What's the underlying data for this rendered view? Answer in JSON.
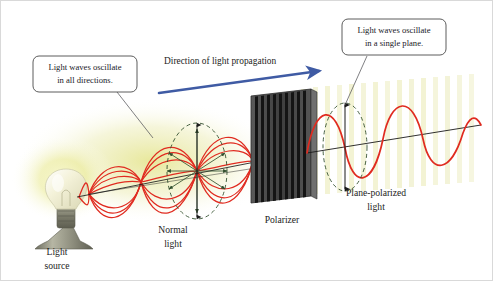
{
  "figure": {
    "background_color": "#ffffff",
    "border_color": "#d9d9d9"
  },
  "callouts": [
    {
      "id": "unpolarized-callout",
      "line1": "Light waves oscillate",
      "line2": "in all directions.",
      "box_fill": "#ffffff",
      "box_stroke": "#4a4a4a",
      "leader_color": "#55565a"
    },
    {
      "id": "polarized-callout",
      "line1": "Light waves oscillate",
      "line2": "in a single plane.",
      "box_fill": "#ffffff",
      "box_stroke": "#4a4a4a",
      "leader_color": "#55565a"
    }
  ],
  "propagation": {
    "label": "Direction of light propagation",
    "arrow_color": "#3f5ba4"
  },
  "labels": [
    {
      "id": "light-source-label",
      "line1": "Light",
      "line2": "source"
    },
    {
      "id": "normal-light-label",
      "line1": "Normal",
      "line2": "light"
    },
    {
      "id": "polarizer-label",
      "line1": "Polarizer",
      "line2": ""
    },
    {
      "id": "plane-polarized-label",
      "line1": "Plane-polarized",
      "line2": "light"
    }
  ],
  "colors": {
    "wave_red": "#e02b20",
    "axis_black": "#1a1a1a",
    "dashed_green": "#33502f",
    "glow_yellow": "#dede6e",
    "polarizer_body": "#4d4d4d",
    "polarizer_slit": "#151515",
    "polarizer_edge": "#6f6f6f",
    "bulb_glass": "#f3f0d8",
    "bulb_base": "#7e7e6d",
    "lamp_stand": "#8c8c7d"
  },
  "elements": {
    "bulb": "light-bulb",
    "polarizer": "polarizer-screen",
    "unpolarized_wave": "unpolarized-light-waves",
    "polarized_wave": "plane-polarized-wave",
    "oscillation_circle_left": "oscillation-direction-circle",
    "oscillation_circle_right": "single-plane-circle"
  }
}
